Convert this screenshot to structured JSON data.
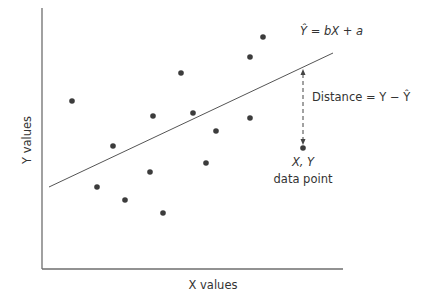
{
  "chart_data": {
    "type": "scatter",
    "title": "",
    "xlabel": "X values",
    "ylabel": "Y values",
    "grid": false,
    "legend": null,
    "axis_ticks": false,
    "points_px": [
      [
        72,
        101
      ],
      [
        97,
        187
      ],
      [
        113,
        146
      ],
      [
        125,
        200
      ],
      [
        150,
        172
      ],
      [
        153,
        116
      ],
      [
        163,
        213
      ],
      [
        181,
        73
      ],
      [
        193,
        113
      ],
      [
        206,
        163
      ],
      [
        216,
        131
      ],
      [
        250,
        57
      ],
      [
        250,
        118
      ],
      [
        263,
        37
      ],
      [
        303,
        148
      ]
    ],
    "regression_line_px": {
      "x1": 49,
      "y1": 187,
      "x2": 333,
      "y2": 53
    },
    "highlight_point_px": [
      303,
      148
    ],
    "annotations": {
      "equation": "Ŷ = bX + a",
      "distance_label": "Distance = Y − Ŷ",
      "point_label_line1": "X, Y",
      "point_label_line2": "data point"
    }
  },
  "colors": {
    "axis": "#6e6e6e",
    "point": "#3c3c3c",
    "line": "#555555",
    "text": "#333333"
  }
}
